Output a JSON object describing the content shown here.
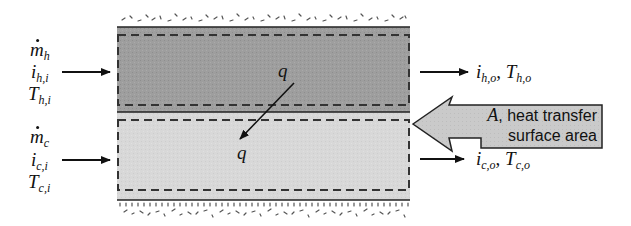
{
  "diagram": {
    "hot_inlet": {
      "flow": {
        "symbol": "m",
        "sub": "h",
        "dot": true
      },
      "enthalpy": {
        "symbol": "i",
        "sub": "h,i"
      },
      "temperature": {
        "symbol": "T",
        "sub": "h,i"
      }
    },
    "cold_inlet": {
      "flow": {
        "symbol": "m",
        "sub": "c",
        "dot": true
      },
      "enthalpy": {
        "symbol": "i",
        "sub": "c,i"
      },
      "temperature": {
        "symbol": "T",
        "sub": "c,i"
      }
    },
    "hot_outlet": {
      "enthalpy": {
        "symbol": "i",
        "sub": "h,o"
      },
      "separator": ", ",
      "temperature": {
        "symbol": "T",
        "sub": "h,o"
      }
    },
    "cold_outlet": {
      "enthalpy": {
        "symbol": "i",
        "sub": "c,o"
      },
      "separator": ", ",
      "temperature": {
        "symbol": "T",
        "sub": "c,o"
      }
    },
    "heat_flow": {
      "top_label": "q",
      "bottom_label": "q"
    },
    "callout": {
      "symbol": "A",
      "line1_rest": ", heat transfer",
      "line2": "surface area"
    },
    "colors": {
      "hot_fluid": "#9c9c9c",
      "cold_fluid": "#d6d6d6",
      "callout_fill": "#c8c8c8",
      "line": "#222222",
      "dashed": "#333333",
      "insulation": "#555555"
    }
  }
}
